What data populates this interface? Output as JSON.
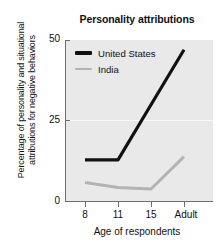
{
  "chart_data": {
    "type": "line",
    "title": "Personality attributions",
    "xlabel": "Age of respondents",
    "ylabel": "Percentage of personality and situational\nattributions for negative behaviors",
    "categories": [
      "8",
      "11",
      "15",
      "Adult"
    ],
    "series": [
      {
        "name": "United States",
        "color": "#111111",
        "values": [
          13,
          13,
          30,
          47
        ]
      },
      {
        "name": "India",
        "color": "#b3b3b3",
        "values": [
          6,
          4.5,
          4,
          14
        ]
      }
    ],
    "ylim": [
      0,
      50
    ],
    "yticks": [
      "0",
      "25",
      "50"
    ],
    "grid": "horizontal-at-25",
    "legend_position": "top-left-inside",
    "plot_background": "#e9e9e9"
  },
  "legend": {
    "entries": [
      {
        "label": "United States"
      },
      {
        "label": "India"
      }
    ]
  }
}
